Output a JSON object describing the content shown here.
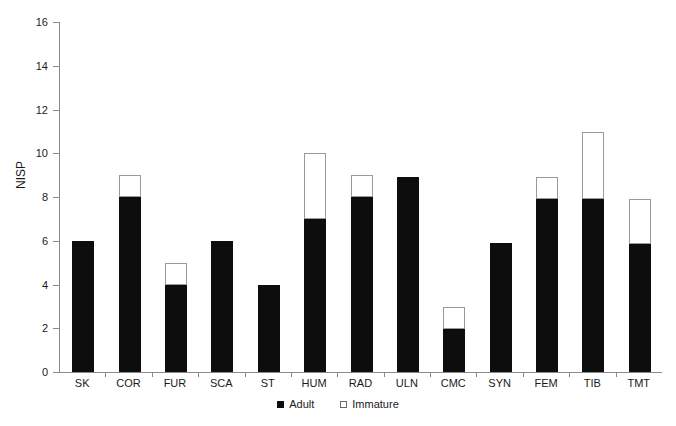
{
  "chart_data": {
    "type": "bar",
    "title": "",
    "xlabel": "",
    "ylabel": "NISP",
    "ylim": [
      0,
      16
    ],
    "ytick_step": 2,
    "yticks": [
      0,
      2,
      4,
      6,
      8,
      10,
      12,
      14,
      16
    ],
    "grid": false,
    "stacked": true,
    "legend_position": "bottom-center",
    "categories": [
      "SK",
      "COR",
      "FUR",
      "SCA",
      "ST",
      "HUM",
      "RAD",
      "ULN",
      "CMC",
      "SYN",
      "FEM",
      "TIB",
      "TMT"
    ],
    "series": [
      {
        "name": "Adult",
        "color": "#0d0d0d",
        "values": [
          6.0,
          8.0,
          4.0,
          6.0,
          4.0,
          7.0,
          8.0,
          8.9,
          1.95,
          5.9,
          7.9,
          7.9,
          5.85
        ]
      },
      {
        "name": "Immature",
        "color": "#ffffff",
        "values": [
          0,
          1.0,
          1.0,
          0,
          0,
          3.0,
          1.0,
          0,
          1.0,
          0,
          1.0,
          3.05,
          2.05
        ]
      }
    ],
    "totals": [
      6.0,
      9.0,
      5.0,
      6.0,
      4.0,
      10.0,
      9.0,
      8.9,
      2.95,
      5.9,
      8.9,
      10.95,
      7.9
    ]
  },
  "axes": {
    "y_title": "NISP",
    "y_tick_labels": [
      "0",
      "2",
      "4",
      "6",
      "8",
      "10",
      "12",
      "14",
      "16"
    ],
    "x_tick_labels": [
      "SK",
      "COR",
      "FUR",
      "SCA",
      "ST",
      "HUM",
      "RAD",
      "ULN",
      "CMC",
      "SYN",
      "FEM",
      "TIB",
      "TMT"
    ]
  },
  "legend": {
    "items": [
      {
        "label": "Adult",
        "marker": "filled-square-icon",
        "color": "#0d0d0d"
      },
      {
        "label": "Immature",
        "marker": "open-square-icon",
        "color": "#ffffff"
      }
    ]
  }
}
